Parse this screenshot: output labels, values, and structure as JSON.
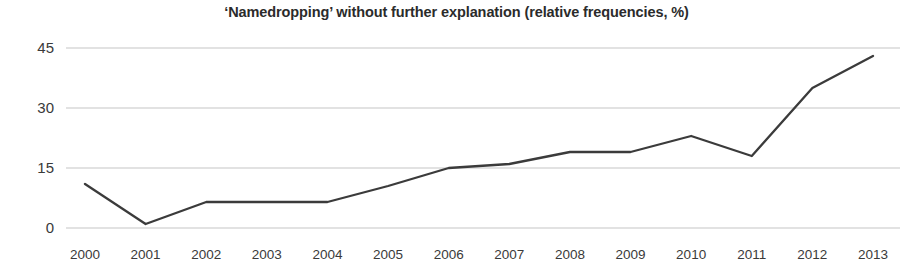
{
  "chart_data": {
    "type": "line",
    "title": "‘Namedropping’ without further explanation (relative frequencies, %)",
    "xlabel": "",
    "ylabel": "",
    "categories": [
      "2000",
      "2001",
      "2002",
      "2003",
      "2004",
      "2005",
      "2006",
      "2007",
      "2008",
      "2009",
      "2010",
      "2011",
      "2012",
      "2013"
    ],
    "values": [
      11,
      1,
      6.5,
      6.5,
      6.5,
      10.5,
      15,
      16,
      19,
      19,
      23,
      18,
      35,
      43
    ],
    "series": [
      {
        "name": "Namedropping without further explanation",
        "values": [
          11,
          1,
          6.5,
          6.5,
          6.5,
          10.5,
          15,
          16,
          19,
          19,
          23,
          18,
          35,
          43
        ]
      }
    ],
    "ylim": [
      0,
      45
    ],
    "yticks": [
      0,
      15,
      30,
      45
    ],
    "ytick_labels": [
      "0",
      "15",
      "30",
      "45"
    ],
    "grid": true,
    "grid_axis": "y",
    "legend": false,
    "legend_position": "none",
    "line_color": "#3b3b3b",
    "grid_color": "#e2e2e2",
    "text_color": "#3a3a3a",
    "background_color": "#ffffff",
    "markers": false
  }
}
